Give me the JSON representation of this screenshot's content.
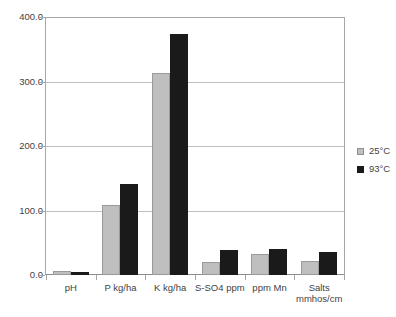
{
  "chart_data": {
    "type": "bar",
    "title": "",
    "xlabel": "",
    "ylabel": "",
    "ylim": [
      0,
      400
    ],
    "ytick_labels": [
      "400.0",
      "300.0",
      "200.0",
      "100.0",
      "0.0"
    ],
    "ytick_values": [
      400,
      300,
      200,
      100,
      0
    ],
    "grid": true,
    "legend_position": "right",
    "categories": [
      "pH",
      "P kg/ha",
      "K kg/ha",
      "S-SO4 ppm",
      "ppm Mn",
      "Salts mmhos/cm"
    ],
    "series": [
      {
        "name": "25°C",
        "color": "#bfbfbf",
        "values": [
          6,
          108,
          313,
          20,
          33,
          22
        ]
      },
      {
        "name": "93°C",
        "color": "#1a1a1a",
        "values": [
          5,
          141,
          374,
          39,
          40,
          36
        ]
      }
    ]
  },
  "legend": {
    "items": [
      {
        "label": "25°C"
      },
      {
        "label": "93°C"
      }
    ]
  }
}
